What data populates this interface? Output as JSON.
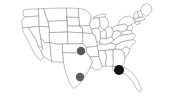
{
  "figure": {
    "type": "map",
    "region": "United States (contiguous 48 states)",
    "background_color": "#ffffff",
    "width": 173,
    "height": 107,
    "has_text_labels": false,
    "has_legend": false,
    "has_title": false,
    "has_axes": false
  },
  "basemap": {
    "name": "us-states-outline",
    "outline_color": "#8a8a8a",
    "fill_color": "#ffffff",
    "stroke_width": 0.55,
    "projection_hint": "albers-usa"
  },
  "markers": [
    {
      "id": "marker-1",
      "label": "central-plains-marker",
      "approx_region": "Kansas / Oklahoma border area",
      "x": 81,
      "y": 51,
      "radius": 4.2,
      "color": "#595959"
    },
    {
      "id": "marker-2",
      "label": "texas-marker",
      "approx_region": "North central Texas",
      "x": 80,
      "y": 77,
      "radius": 4.2,
      "color": "#5e5e5e"
    },
    {
      "id": "marker-3",
      "label": "deep-south-marker",
      "approx_region": "Alabama / Georgia border area",
      "x": 119,
      "y": 70,
      "radius": 5.0,
      "color": "#111111"
    }
  ],
  "chart_data": {
    "type": "scatter",
    "title": "",
    "xlabel": "",
    "ylabel": "",
    "basemap": "United States state outlines",
    "points": [
      {
        "name": "central-plains-marker",
        "x": 81,
        "y": 51,
        "size": 4.2,
        "color": "#595959"
      },
      {
        "name": "texas-marker",
        "x": 80,
        "y": 77,
        "size": 4.2,
        "color": "#5e5e5e"
      },
      {
        "name": "deep-south-marker",
        "x": 119,
        "y": 70,
        "size": 5.0,
        "color": "#111111"
      }
    ],
    "legend": [],
    "grid": false
  }
}
